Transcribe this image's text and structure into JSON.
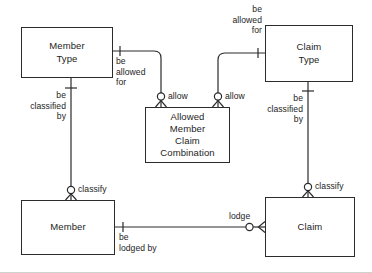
{
  "diagram": {
    "type": "entity-relationship-diagram",
    "stroke_color": "#2b2b2b",
    "text_color": "#1d1d1d",
    "background_color": "#ffffff",
    "entities": [
      {
        "id": "member-type",
        "label": "Member\nType",
        "x": 21,
        "y": 27,
        "w": 92,
        "h": 51
      },
      {
        "id": "claim-type",
        "label": "Claim\nType",
        "x": 265,
        "y": 25,
        "w": 88,
        "h": 57
      },
      {
        "id": "allowed-member-claim-combination",
        "label": "Allowed\nMember\nClaim\nCombination",
        "x": 145,
        "y": 107,
        "w": 85,
        "h": 56
      },
      {
        "id": "member",
        "label": "Member",
        "x": 21,
        "y": 200,
        "w": 94,
        "h": 55
      },
      {
        "id": "claim",
        "label": "Claim",
        "x": 265,
        "y": 197,
        "w": 90,
        "h": 60
      }
    ],
    "relationships": [
      {
        "id": "member-type-be-allowed-for",
        "label": "be\nallowed\nfor",
        "from": "member-type",
        "to": "allowed-member-claim-combination"
      },
      {
        "id": "claim-type-be-allowed-for",
        "label": "be\nallowed\nfor",
        "from": "claim-type",
        "to": "allowed-member-claim-combination"
      },
      {
        "id": "allow-left",
        "label": "allow",
        "from": "member-type",
        "to": "allowed-member-claim-combination"
      },
      {
        "id": "allow-right",
        "label": "allow",
        "from": "claim-type",
        "to": "allowed-member-claim-combination"
      },
      {
        "id": "member-type-be-classified-by",
        "label": "be\nclassified\nby",
        "from": "member-type",
        "to": "member"
      },
      {
        "id": "claim-type-be-classified-by",
        "label": "be\nclassified\nby",
        "from": "claim-type",
        "to": "claim"
      },
      {
        "id": "classify-member",
        "label": "classify",
        "from": "member-type",
        "to": "member"
      },
      {
        "id": "classify-claim",
        "label": "classify",
        "from": "claim-type",
        "to": "claim"
      },
      {
        "id": "member-be-lodged-by",
        "label": "be\nlodged by",
        "from": "member",
        "to": "claim"
      },
      {
        "id": "lodge",
        "label": "lodge",
        "from": "member",
        "to": "claim"
      }
    ]
  }
}
